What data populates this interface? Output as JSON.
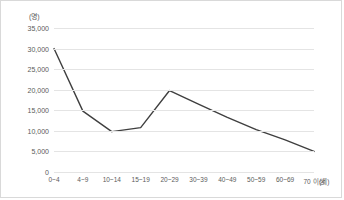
{
  "chart_data": {
    "type": "line",
    "title": "",
    "subtitle": "",
    "xlabel": "(세)",
    "ylabel": "(명)",
    "categories": [
      "0~4",
      "4~9",
      "10~14",
      "15~19",
      "20~29",
      "30~39",
      "40~49",
      "50~59",
      "60~69",
      "70 이상"
    ],
    "series": [
      {
        "name": "",
        "values": [
          30000,
          14800,
          9800,
          10800,
          19800,
          16500,
          13300,
          10300,
          7800,
          5000
        ]
      }
    ],
    "ylim": [
      0,
      35000
    ],
    "y_ticks": [
      0,
      5000,
      10000,
      15000,
      20000,
      25000,
      30000,
      35000
    ],
    "y_tick_labels": [
      "0",
      "5,000",
      "10,000",
      "15,000",
      "20,000",
      "25,000",
      "30,000",
      "35,000"
    ],
    "grid": "horizontal",
    "legend": "none",
    "line_color": "#3f3f3f",
    "gridline_color": "#e4e4e4",
    "text_color": "#5a5a5a",
    "background_color": "#ffffff",
    "border_color": "#d9d9d9"
  }
}
